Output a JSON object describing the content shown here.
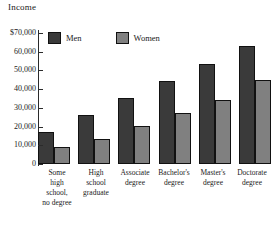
{
  "chart_data": {
    "type": "bar",
    "title": "",
    "ylabel": "Income",
    "xlabel": "",
    "grid": false,
    "legend_position": "top-left",
    "ylim": [
      0,
      70000
    ],
    "ytick_values": [
      0,
      10000,
      20000,
      30000,
      40000,
      50000,
      60000,
      70000
    ],
    "ytick_labels": [
      "0",
      "10,000",
      "20,000",
      "30,000",
      "40,000",
      "50,000",
      "60,000",
      "$70,000"
    ],
    "categories": [
      "Some high school, no degree",
      "High school graduate",
      "Associate degree",
      "Bachelor's degree",
      "Master's degree",
      "Doctorate degree"
    ],
    "category_lines": [
      [
        "Some",
        "high",
        "school,",
        "no degree"
      ],
      [
        "High",
        "school",
        "graduate"
      ],
      [
        "Associate",
        "degree"
      ],
      [
        "Bachelor's",
        "degree"
      ],
      [
        "Master's",
        "degree"
      ],
      [
        "Doctorate",
        "degree"
      ]
    ],
    "series": [
      {
        "name": "Men",
        "color": "#3a3a3a",
        "values": [
          17000,
          26000,
          35500,
          44500,
          53500,
          63000
        ]
      },
      {
        "name": "Women",
        "color": "#808080",
        "values": [
          9000,
          13500,
          20500,
          27000,
          34000,
          45000
        ]
      }
    ]
  },
  "legend": {
    "items": [
      {
        "label": "Men"
      },
      {
        "label": "Women"
      }
    ]
  }
}
